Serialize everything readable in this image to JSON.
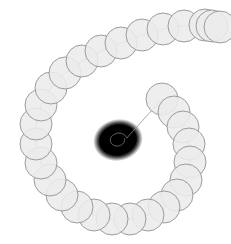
{
  "figure": {
    "type": "vector-illustration",
    "width": 231,
    "height": 244,
    "background_color": "#ffffff"
  },
  "colors": {
    "background": "#ffffff",
    "spiral_stroke": "#1a1a1a",
    "core_fill": "#000000",
    "bead_fill": "#ececec",
    "bead_stroke": "#8d8d8d",
    "arm_line": "#8f8f8f"
  },
  "chart_data": {
    "type": "line",
    "subtitle": "",
    "xlabel": "",
    "ylabel": "",
    "xlim": [
      0,
      231
    ],
    "ylim": [
      0,
      244
    ],
    "grid": false,
    "legend": "none",
    "annotations": [],
    "series": [
      {
        "name": "inner-spiral",
        "kind": "logarithmic-spiral",
        "center": [
          118,
          140
        ],
        "growth_rate_b": 0.0455,
        "initial_radius_a": 0.9,
        "theta_start_deg": 0,
        "theta_end_deg": 2520,
        "rotation_deg": -12,
        "ellipse_aspect_ratio": 0.82,
        "turns": 7,
        "stroke_width": 0.62,
        "description": "Tightly wound spiral; innermost windings converge into a solid black core"
      },
      {
        "name": "outer-arm",
        "kind": "logarithmic-spiral-continuation",
        "center": [
          118,
          140
        ],
        "theta_start_deg": 2520,
        "theta_end_deg": 2880,
        "description": "Arm unwinding outward counter-clockwise from the core to the upper-right terminus"
      },
      {
        "name": "bead-chain",
        "kind": "circles-along-path",
        "bead_radius": 16,
        "bead_count": 23,
        "bead_centers": [
          [
            162,
            99
          ],
          [
            174,
            112
          ],
          [
            183,
            127
          ],
          [
            189,
            144
          ],
          [
            190,
            162
          ],
          [
            186,
            180
          ],
          [
            177,
            195
          ],
          [
            164,
            207
          ],
          [
            148,
            215
          ],
          [
            130,
            219
          ],
          [
            112,
            219
          ],
          [
            94,
            215
          ],
          [
            77,
            207
          ],
          [
            62,
            195
          ],
          [
            50,
            180
          ],
          [
            41,
            163
          ],
          [
            36,
            144
          ],
          [
            36,
            124
          ],
          [
            41,
            105
          ],
          [
            51,
            88
          ],
          [
            65,
            73
          ],
          [
            82,
            61
          ],
          [
            101,
            51
          ]
        ],
        "description": "Overlapping translucent circles of constant radius laid along the spiral arm"
      },
      {
        "name": "bead-chain-outer",
        "kind": "circles-along-path",
        "bead_radius": 16,
        "bead_count": 7,
        "bead_centers": [
          [
            121,
            43
          ],
          [
            142,
            35
          ],
          [
            163,
            29
          ],
          [
            184,
            26
          ],
          [
            205,
            25
          ],
          [
            212,
            26
          ],
          [
            220,
            27
          ]
        ],
        "description": "Outer beads continuing across the top toward the right edge terminus"
      }
    ],
    "core": {
      "name": "black-core",
      "center": [
        118,
        140
      ],
      "radius_x": 23,
      "radius_y": 19,
      "color": "#000000",
      "description": "Solid black blob where the innermost spiral windings merge"
    }
  }
}
